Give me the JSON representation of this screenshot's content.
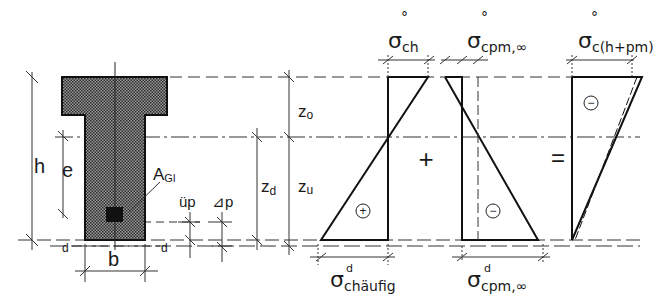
{
  "cross_section": {
    "height_label": "h",
    "eccentricity_label": "e",
    "tendon_area_label": "A",
    "tendon_area_sub": "Gl",
    "width_label": "b",
    "cover_left_label": "d",
    "cover_right_label": "d",
    "offset_up_label": "üp",
    "offset_dp_label": "⊿p"
  },
  "dimensions": {
    "z_top_label": "z",
    "z_top_sub": "o",
    "z_bottom_label": "z",
    "z_bottom_sub": "u",
    "z_d_label": "z",
    "z_d_sub": "d"
  },
  "diagram_1": {
    "top_label": "σ",
    "top_sup": "°",
    "top_sub": "ch",
    "bottom_label": "σ",
    "bottom_sup": "d",
    "bottom_sub": "chäufig",
    "sign": "+"
  },
  "operator_plus": "+",
  "diagram_2": {
    "top_label": "σ",
    "top_sup": "°",
    "top_sub": "cpm,∞",
    "bottom_label": "σ",
    "bottom_sup": "d",
    "bottom_sub": "cpm,∞",
    "sign": "−"
  },
  "operator_equals": "=",
  "diagram_3": {
    "top_label": "σ",
    "top_sup": "°",
    "top_sub": "c(h+pm)",
    "sign": "−"
  }
}
